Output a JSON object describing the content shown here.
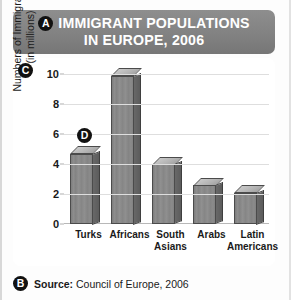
{
  "title": {
    "marker": "A",
    "line1": "IMMIGRANT POPULATIONS",
    "line2": "IN EUROPE, 2006"
  },
  "markers": {
    "a": "A",
    "b": "B",
    "c": "C",
    "d": "D"
  },
  "footer": {
    "marker": "B",
    "label": "Source:",
    "value": " Council of Europe, 2006"
  },
  "axis": {
    "y_title_line1": "Numbers of Immigrants",
    "y_title_line2": "(in millions)"
  },
  "colors": {
    "banner": "#828282",
    "bar_front": "#888888",
    "bar_side": "#616161",
    "bar_top": "#b8b8b8",
    "grid": "#dedede",
    "marker": "#111111",
    "text": "#1a1a1a",
    "background": "#ffffff"
  },
  "chart_data": {
    "type": "bar",
    "title": "IMMIGRANT POPULATIONS IN EUROPE, 2006",
    "xlabel": "",
    "ylabel": "Numbers of Immigrants (in millions)",
    "categories": [
      "Turks",
      "Africans",
      "South Asians",
      "Arabs",
      "Latin Americans"
    ],
    "category_lines": [
      [
        "Turks"
      ],
      [
        "Africans"
      ],
      [
        "South",
        "Asians"
      ],
      [
        "Arabs"
      ],
      [
        "Latin",
        "Americans"
      ]
    ],
    "values": [
      4.7,
      9.9,
      4.0,
      2.6,
      2.1
    ],
    "ylim": [
      0,
      10
    ],
    "yticks": [
      0,
      2,
      4,
      6,
      8,
      10
    ],
    "ytick_labels": [
      "0",
      "2",
      "4",
      "6",
      "8",
      "10"
    ],
    "grid": true,
    "legend": "none",
    "source": "Source: Council of Europe, 2006",
    "annotations": [
      "A",
      "B",
      "C",
      "D"
    ]
  }
}
